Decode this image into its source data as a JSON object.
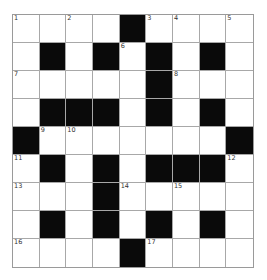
{
  "puzzle": {
    "rows": 9,
    "cols": 9,
    "grid": [
      "....#....",
      ".#.#.#.#.",
      ".....#...",
      ".###.#.#.",
      "#.......#",
      ".#.#.###.",
      "...#.....",
      ".#.#.#.#.",
      "....#...."
    ],
    "numbers": [
      {
        "n": "1",
        "r": 0,
        "c": 0
      },
      {
        "n": "2",
        "r": 0,
        "c": 2
      },
      {
        "n": "3",
        "r": 0,
        "c": 5
      },
      {
        "n": "4",
        "r": 0,
        "c": 6
      },
      {
        "n": "5",
        "r": 0,
        "c": 8
      },
      {
        "n": "6",
        "r": 1,
        "c": 4
      },
      {
        "n": "7",
        "r": 2,
        "c": 0
      },
      {
        "n": "8",
        "r": 2,
        "c": 6
      },
      {
        "n": "9",
        "r": 4,
        "c": 1
      },
      {
        "n": "10",
        "r": 4,
        "c": 2
      },
      {
        "n": "11",
        "r": 5,
        "c": 0
      },
      {
        "n": "12",
        "r": 5,
        "c": 8
      },
      {
        "n": "13",
        "r": 6,
        "c": 0
      },
      {
        "n": "14",
        "r": 6,
        "c": 4
      },
      {
        "n": "15",
        "r": 6,
        "c": 6
      },
      {
        "n": "16",
        "r": 8,
        "c": 0
      },
      {
        "n": "17",
        "r": 8,
        "c": 5
      }
    ],
    "colors": {
      "black_cell": "#0a0a0a",
      "white_cell": "#ffffff",
      "grid_line": "#a8a8a8"
    }
  }
}
